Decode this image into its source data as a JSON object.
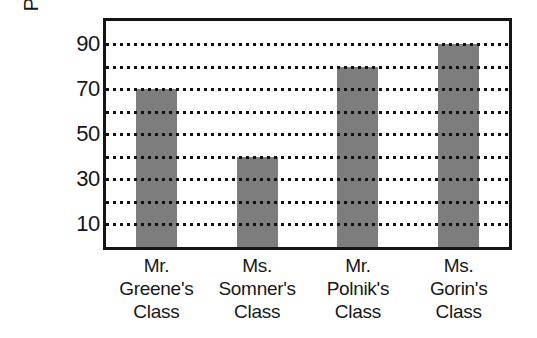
{
  "chart_data": {
    "type": "bar",
    "title": "",
    "xlabel": "",
    "ylabel": "Pounds of paper",
    "categories": [
      "Mr. Greene's Class",
      "Ms. Somner's Class",
      "Mr. Polnik's Class",
      "Ms. Gorin's Class"
    ],
    "category_lines": [
      [
        "Mr.",
        "Greene's",
        "Class"
      ],
      [
        "Ms.",
        "Somner's",
        "Class"
      ],
      [
        "Mr.",
        "Polnik's",
        "Class"
      ],
      [
        "Ms.",
        "Gorin's",
        "Class"
      ]
    ],
    "values": [
      70,
      40,
      80,
      90
    ],
    "ylim": [
      0,
      100
    ],
    "y_tick_labels": [
      "90",
      "70",
      "50",
      "30",
      "10"
    ],
    "y_tick_values": [
      90,
      70,
      50,
      30,
      10
    ],
    "gridline_values": [
      90,
      80,
      70,
      60,
      50,
      40,
      30,
      20,
      10
    ],
    "grid": true,
    "grid_style": "dotted",
    "legend": "none",
    "bar_color": "#7d7d7d",
    "axis_color": "#141414",
    "gridline_color": "#111111",
    "background_color": "#ffffff"
  }
}
